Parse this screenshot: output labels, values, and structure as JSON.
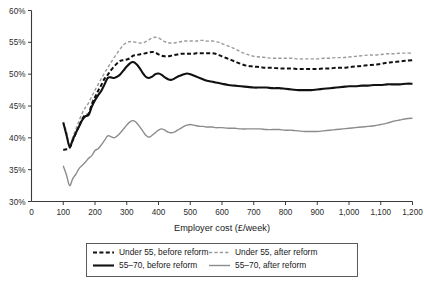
{
  "chart_data": {
    "type": "line",
    "title": "",
    "xlabel": "Employer cost (£/week)",
    "ylabel": "",
    "xlim": [
      0,
      1200
    ],
    "ylim": [
      30,
      60
    ],
    "xticks": [
      0,
      100,
      200,
      300,
      400,
      500,
      600,
      700,
      800,
      900,
      1000,
      1100,
      1200
    ],
    "xtick_labels": [
      "0",
      "100",
      "200",
      "300",
      "400",
      "500",
      "600",
      "700",
      "800",
      "900",
      "1,000",
      "1,100",
      "1,200"
    ],
    "yticks": [
      30,
      35,
      40,
      45,
      50,
      55,
      60
    ],
    "ytick_labels": [
      "30%",
      "35%",
      "40%",
      "45%",
      "50%",
      "55%",
      "60%"
    ],
    "grid": false,
    "legend_position": "below",
    "x": [
      100,
      110,
      120,
      130,
      140,
      150,
      160,
      170,
      180,
      190,
      200,
      210,
      220,
      230,
      240,
      250,
      260,
      270,
      280,
      290,
      300,
      310,
      320,
      330,
      340,
      350,
      360,
      370,
      380,
      390,
      400,
      410,
      420,
      430,
      440,
      450,
      460,
      470,
      480,
      490,
      500,
      510,
      520,
      530,
      540,
      550,
      560,
      570,
      580,
      590,
      600,
      620,
      640,
      660,
      680,
      700,
      720,
      740,
      760,
      780,
      800,
      820,
      840,
      860,
      880,
      900,
      920,
      940,
      960,
      980,
      1000,
      1020,
      1040,
      1060,
      1080,
      1100,
      1120,
      1140,
      1160,
      1180,
      1200
    ],
    "series": [
      {
        "name": "Under 55, before reform",
        "color": "#111111",
        "style": "dashed",
        "width": 2.0,
        "values": [
          38.1,
          38.2,
          38.4,
          39.6,
          40.8,
          41.9,
          43.0,
          43.6,
          43.8,
          45.3,
          46.4,
          47.4,
          48.3,
          49.3,
          49.9,
          50.6,
          51.2,
          51.7,
          52.1,
          52.2,
          52.3,
          52.5,
          52.9,
          53.0,
          53.1,
          53.2,
          53.3,
          53.4,
          53.5,
          53.4,
          53.1,
          52.9,
          52.8,
          52.8,
          52.9,
          53.0,
          53.1,
          53.2,
          53.2,
          53.2,
          53.2,
          53.2,
          53.3,
          53.3,
          53.3,
          53.3,
          53.3,
          53.3,
          53.2,
          53.0,
          52.8,
          52.4,
          52.0,
          51.6,
          51.3,
          51.2,
          51.1,
          51.0,
          51.0,
          50.9,
          50.9,
          50.9,
          50.8,
          50.8,
          50.8,
          50.8,
          50.9,
          50.9,
          51.0,
          51.0,
          51.1,
          51.2,
          51.3,
          51.4,
          51.5,
          51.6,
          51.8,
          51.9,
          52.0,
          52.1,
          52.2
        ]
      },
      {
        "name": "Under 55, after reform",
        "color": "#9a9a9a",
        "style": "dashed",
        "width": 1.4,
        "values": [
          42.5,
          41.0,
          38.7,
          40.1,
          41.4,
          42.7,
          43.9,
          44.8,
          45.5,
          46.5,
          47.5,
          48.4,
          49.3,
          50.2,
          51.0,
          51.8,
          52.6,
          53.3,
          54.0,
          54.6,
          55.0,
          55.1,
          55.1,
          55.0,
          54.9,
          54.9,
          55.1,
          55.4,
          55.7,
          55.8,
          55.7,
          55.4,
          55.1,
          54.9,
          54.9,
          54.9,
          55.0,
          55.1,
          55.2,
          55.2,
          55.2,
          55.2,
          55.2,
          55.3,
          55.3,
          55.2,
          55.2,
          55.2,
          55.1,
          55.0,
          54.8,
          54.4,
          54.0,
          53.5,
          53.1,
          52.8,
          52.7,
          52.6,
          52.5,
          52.5,
          52.5,
          52.5,
          52.4,
          52.4,
          52.4,
          52.4,
          52.5,
          52.5,
          52.6,
          52.6,
          52.7,
          52.8,
          52.9,
          53.0,
          53.0,
          53.1,
          53.2,
          53.2,
          53.3,
          53.3,
          53.3
        ]
      },
      {
        "name": "55–70, before reform",
        "color": "#111111",
        "style": "solid",
        "width": 2.1,
        "values": [
          42.4,
          40.5,
          38.6,
          39.7,
          40.8,
          41.8,
          42.8,
          43.4,
          43.6,
          44.9,
          45.9,
          46.7,
          47.4,
          48.4,
          49.4,
          49.5,
          49.4,
          49.6,
          50.0,
          50.6,
          51.2,
          51.7,
          51.9,
          51.6,
          51.0,
          50.2,
          49.6,
          49.4,
          49.6,
          50.0,
          50.1,
          49.9,
          49.5,
          49.2,
          49.1,
          49.3,
          49.6,
          49.8,
          50.0,
          50.1,
          50.0,
          49.8,
          49.6,
          49.4,
          49.2,
          49.0,
          48.9,
          48.8,
          48.7,
          48.6,
          48.5,
          48.3,
          48.2,
          48.1,
          48.0,
          47.9,
          47.9,
          47.9,
          47.8,
          47.8,
          47.7,
          47.6,
          47.5,
          47.5,
          47.5,
          47.6,
          47.7,
          47.8,
          47.9,
          48.0,
          48.1,
          48.1,
          48.2,
          48.2,
          48.3,
          48.3,
          48.4,
          48.4,
          48.4,
          48.5,
          48.5
        ]
      },
      {
        "name": "55–70, after reform",
        "color": "#8c8c8c",
        "style": "solid",
        "width": 1.4,
        "values": [
          35.6,
          34.2,
          32.5,
          33.6,
          34.3,
          35.2,
          35.7,
          36.2,
          36.8,
          37.2,
          38.0,
          38.3,
          38.9,
          39.6,
          40.3,
          40.2,
          40.0,
          40.3,
          40.8,
          41.4,
          42.0,
          42.5,
          42.7,
          42.4,
          41.8,
          41.1,
          40.4,
          40.1,
          40.4,
          40.8,
          41.2,
          41.4,
          41.2,
          40.9,
          40.8,
          40.9,
          41.2,
          41.5,
          41.8,
          42.0,
          42.1,
          42.0,
          41.9,
          41.8,
          41.8,
          41.7,
          41.7,
          41.7,
          41.6,
          41.6,
          41.6,
          41.5,
          41.5,
          41.4,
          41.4,
          41.4,
          41.4,
          41.3,
          41.3,
          41.3,
          41.2,
          41.2,
          41.1,
          41.0,
          41.0,
          41.0,
          41.1,
          41.2,
          41.3,
          41.4,
          41.5,
          41.6,
          41.7,
          41.8,
          41.9,
          42.1,
          42.3,
          42.6,
          42.8,
          43.0,
          43.1
        ]
      }
    ],
    "legend": [
      {
        "label": "Under 55, before reform",
        "color": "#111111",
        "style": "dashed",
        "width": 2.0
      },
      {
        "label": "Under 55, after reform",
        "color": "#9a9a9a",
        "style": "dashed",
        "width": 1.4
      },
      {
        "label": "55–70, before reform",
        "color": "#111111",
        "style": "solid",
        "width": 2.1
      },
      {
        "label": "55–70, after reform",
        "color": "#8c8c8c",
        "style": "solid",
        "width": 1.4
      }
    ]
  }
}
